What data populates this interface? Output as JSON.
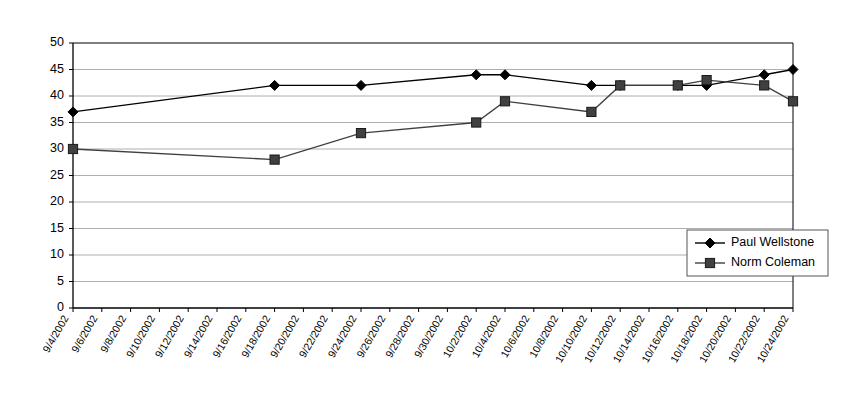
{
  "chart_data": {
    "type": "line",
    "title": "",
    "xlabel": "",
    "ylabel": "",
    "ylim": [
      0,
      50
    ],
    "ytick_step": 5,
    "yticks": [
      0,
      5,
      10,
      15,
      20,
      25,
      30,
      35,
      40,
      45,
      50
    ],
    "grid": true,
    "legend_position": "right-inside",
    "categories": [
      "9/4/2002",
      "9/6/2002",
      "9/8/2002",
      "9/10/2002",
      "9/12/2002",
      "9/14/2002",
      "9/16/2002",
      "9/18/2002",
      "9/20/2002",
      "9/22/2002",
      "9/24/2002",
      "9/26/2002",
      "9/28/2002",
      "9/30/2002",
      "10/2/2002",
      "10/4/2002",
      "10/6/2002",
      "10/8/2002",
      "10/10/2002",
      "10/12/2002",
      "10/14/2002",
      "10/16/2002",
      "10/18/2002",
      "10/20/2002",
      "10/22/2002",
      "10/24/2002"
    ],
    "series": [
      {
        "name": "Paul Wellstone",
        "marker": "diamond",
        "color": "#000000",
        "points": [
          {
            "x": "9/4/2002",
            "y": 37
          },
          {
            "x": "9/18/2002",
            "y": 42
          },
          {
            "x": "9/24/2002",
            "y": 42
          },
          {
            "x": "10/2/2002",
            "y": 44
          },
          {
            "x": "10/4/2002",
            "y": 44
          },
          {
            "x": "10/10/2002",
            "y": 42
          },
          {
            "x": "10/12/2002",
            "y": 42
          },
          {
            "x": "10/16/2002",
            "y": 42
          },
          {
            "x": "10/18/2002",
            "y": 42
          },
          {
            "x": "10/22/2002",
            "y": 44
          },
          {
            "x": "10/24/2002",
            "y": 45
          }
        ]
      },
      {
        "name": "Norm Coleman",
        "marker": "square",
        "color": "#404040",
        "points": [
          {
            "x": "9/4/2002",
            "y": 30
          },
          {
            "x": "9/18/2002",
            "y": 28
          },
          {
            "x": "9/24/2002",
            "y": 33
          },
          {
            "x": "10/2/2002",
            "y": 35
          },
          {
            "x": "10/4/2002",
            "y": 39
          },
          {
            "x": "10/10/2002",
            "y": 37
          },
          {
            "x": "10/12/2002",
            "y": 42
          },
          {
            "x": "10/16/2002",
            "y": 42
          },
          {
            "x": "10/18/2002",
            "y": 43
          },
          {
            "x": "10/22/2002",
            "y": 42
          },
          {
            "x": "10/24/2002",
            "y": 39
          }
        ]
      }
    ]
  },
  "legend": {
    "items": [
      {
        "label": "Paul Wellstone"
      },
      {
        "label": "Norm Coleman"
      }
    ]
  }
}
